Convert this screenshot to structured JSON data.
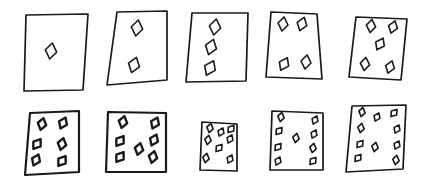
{
  "title": "Hand-drawn playing cards with 1 to 10 diamonds",
  "style": {
    "ink": "#1a1a1a",
    "paper": "#ffffff"
  },
  "cards": [
    {
      "label": "1 diamond",
      "count": 1,
      "box": [
        24,
        14,
        88,
        92
      ],
      "poly": [
        [
          26,
          15
        ],
        [
          88,
          14
        ],
        [
          83,
          90
        ],
        [
          24,
          91
        ]
      ],
      "pips": [
        [
          51,
          51
        ]
      ],
      "pip_size": 8
    },
    {
      "label": "2 diamonds",
      "count": 2,
      "box": [
        107,
        10,
        167,
        86
      ],
      "poly": [
        [
          117,
          12
        ],
        [
          167,
          11
        ],
        [
          167,
          80
        ],
        [
          107,
          85
        ]
      ],
      "pips": [
        [
          137,
          28
        ],
        [
          134,
          65
        ]
      ],
      "pip_size": 8
    },
    {
      "label": "3 diamonds",
      "count": 3,
      "box": [
        186,
        12,
        248,
        82
      ],
      "poly": [
        [
          192,
          13
        ],
        [
          248,
          13
        ],
        [
          246,
          81
        ],
        [
          186,
          82
        ]
      ],
      "pips": [
        [
          215,
          27
        ],
        [
          211,
          47
        ],
        [
          210,
          68
        ]
      ],
      "pip_size": 8
    },
    {
      "label": "4 diamonds",
      "count": 4,
      "box": [
        266,
        10,
        322,
        80
      ],
      "poly": [
        [
          271,
          12
        ],
        [
          317,
          14
        ],
        [
          322,
          79
        ],
        [
          266,
          77
        ]
      ],
      "pips": [
        [
          283,
          24
        ],
        [
          302,
          24
        ],
        [
          284,
          64
        ],
        [
          306,
          62
        ]
      ],
      "pip_size": 7
    },
    {
      "label": "5 diamonds",
      "count": 5,
      "box": [
        349,
        14,
        407,
        80
      ],
      "poly": [
        [
          356,
          17
        ],
        [
          407,
          19
        ],
        [
          401,
          80
        ],
        [
          349,
          77
        ]
      ],
      "pips": [
        [
          371,
          26
        ],
        [
          393,
          27
        ],
        [
          380,
          44
        ],
        [
          365,
          64
        ],
        [
          390,
          67
        ]
      ],
      "pip_size": 6.5
    },
    {
      "label": "6 diamonds",
      "count": 6,
      "box": [
        25,
        110,
        80,
        176
      ],
      "poly": [
        [
          30,
          113
        ],
        [
          79,
          111
        ],
        [
          79,
          172
        ],
        [
          25,
          175
        ]
      ],
      "pips": [
        [
          42,
          124
        ],
        [
          63,
          123
        ],
        [
          37,
          144
        ],
        [
          62,
          144
        ],
        [
          36,
          160
        ],
        [
          62,
          161
        ]
      ],
      "pip_size": 6
    },
    {
      "label": "7 diamonds",
      "count": 7,
      "box": [
        106,
        110,
        166,
        174
      ],
      "poly": [
        [
          108,
          112
        ],
        [
          166,
          113
        ],
        [
          166,
          172
        ],
        [
          106,
          172
        ]
      ],
      "pips": [
        [
          123,
          122
        ],
        [
          155,
          123
        ],
        [
          120,
          141
        ],
        [
          139,
          149
        ],
        [
          154,
          140
        ],
        [
          120,
          157
        ],
        [
          153,
          157
        ]
      ],
      "pip_size": 6
    },
    {
      "label": "8 diamonds",
      "count": 8,
      "box": [
        200,
        120,
        237,
        172
      ],
      "poly": [
        [
          202,
          122
        ],
        [
          237,
          124
        ],
        [
          237,
          171
        ],
        [
          200,
          170
        ]
      ],
      "pips": [
        [
          210,
          128
        ],
        [
          221,
          132
        ],
        [
          231,
          129
        ],
        [
          208,
          140
        ],
        [
          230,
          139
        ],
        [
          219,
          148
        ],
        [
          206,
          158
        ],
        [
          230,
          159
        ]
      ],
      "pip_size": 4.5
    },
    {
      "label": "9 diamonds",
      "count": 9,
      "box": [
        270,
        109,
        323,
        171
      ],
      "poly": [
        [
          272,
          111
        ],
        [
          323,
          113
        ],
        [
          323,
          170
        ],
        [
          270,
          170
        ]
      ],
      "pips": [
        [
          281,
          117
        ],
        [
          315,
          120
        ],
        [
          279,
          131
        ],
        [
          296,
          138
        ],
        [
          314,
          134
        ],
        [
          278,
          147
        ],
        [
          313,
          148
        ],
        [
          278,
          161
        ],
        [
          313,
          161
        ]
      ],
      "pip_size": 4.5
    },
    {
      "label": "10 diamonds",
      "count": 10,
      "box": [
        346,
        104,
        406,
        172
      ],
      "poly": [
        [
          352,
          106
        ],
        [
          406,
          105
        ],
        [
          403,
          169
        ],
        [
          346,
          172
        ]
      ],
      "pips": [
        [
          362,
          112
        ],
        [
          377,
          117
        ],
        [
          394,
          113
        ],
        [
          361,
          128
        ],
        [
          397,
          129
        ],
        [
          360,
          144
        ],
        [
          375,
          147
        ],
        [
          397,
          145
        ],
        [
          358,
          158
        ],
        [
          396,
          160
        ]
      ],
      "pip_size": 4.5
    }
  ]
}
